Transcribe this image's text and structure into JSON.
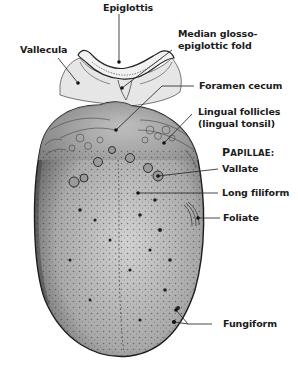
{
  "diagram": {
    "labels": {
      "epiglottis": "Epiglottis",
      "vallecula": "Vallecula",
      "median_fold_line1": "Median glosso-",
      "median_fold_line2": "epiglottic fold",
      "foramen_cecum": "Foramen cecum",
      "lingual_follicles_line1": "Lingual follicles",
      "lingual_follicles_line2": "(lingual tonsil)",
      "papillae_heading_initial": "P",
      "papillae_heading_rest": "APILLAE:",
      "vallate": "Vallate",
      "long_filiform": "Long filiform",
      "foliate": "Foliate",
      "fungiform": "Fungiform"
    },
    "colors": {
      "background": "#ffffff",
      "text": "#1a1a1a",
      "tongue_fill": "#b8b8b8",
      "tongue_outline": "#2a2a2a",
      "leader_line": "#333333"
    }
  }
}
